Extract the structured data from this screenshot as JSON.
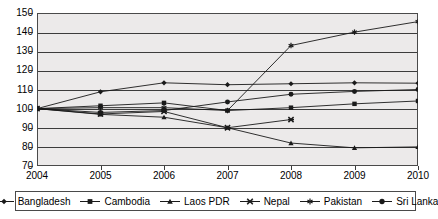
{
  "chart_data": {
    "type": "line",
    "title": "",
    "xlabel": "",
    "ylabel": "",
    "x": [
      2004,
      2005,
      2006,
      2007,
      2008,
      2009,
      2010
    ],
    "xlim": [
      2004,
      2010
    ],
    "ylim": [
      70,
      150
    ],
    "yticks": [
      70,
      80,
      90,
      100,
      110,
      120,
      130,
      140,
      150
    ],
    "xticks": [
      "2004",
      "2005",
      "2006",
      "2007",
      "2008",
      "2009",
      "2010"
    ],
    "grid": true,
    "legend_position": "bottom",
    "series": [
      {
        "name": "Bangladesh",
        "marker": "diamond",
        "values": [
          100,
          108.8,
          113.5,
          112.5,
          113,
          113.5,
          113.3
        ]
      },
      {
        "name": "Cambodia",
        "marker": "square",
        "values": [
          100,
          101.5,
          103,
          99,
          100.5,
          102.5,
          104
        ]
      },
      {
        "name": "Laos PDR",
        "marker": "triangle",
        "values": [
          100,
          97,
          95.5,
          90,
          82,
          79.5,
          80
        ]
      },
      {
        "name": "Nepal",
        "marker": "x-cross",
        "values": [
          100,
          97.2,
          98.5,
          90,
          94.3,
          null,
          null
        ]
      },
      {
        "name": "Pakistan",
        "marker": "asterisk",
        "values": [
          100,
          100.5,
          100.5,
          99,
          133,
          140,
          145.5
        ]
      },
      {
        "name": "Sri Lanka",
        "marker": "circle",
        "values": [
          100,
          98,
          99,
          103.5,
          107.5,
          109,
          110
        ]
      }
    ]
  },
  "legend": {
    "items": [
      {
        "label": "Bangladesh",
        "marker": "diamond"
      },
      {
        "label": "Cambodia",
        "marker": "square"
      },
      {
        "label": "Laos PDR",
        "marker": "triangle"
      },
      {
        "label": "Nepal",
        "marker": "x-cross"
      },
      {
        "label": "Pakistan",
        "marker": "asterisk"
      },
      {
        "label": "Sri Lanka",
        "marker": "circle"
      }
    ]
  },
  "style": {
    "plot_background": "#eceaea",
    "axis_color": "#3c3c3c",
    "series_color": "#1a1a1a",
    "page_background": "#ffffff"
  }
}
